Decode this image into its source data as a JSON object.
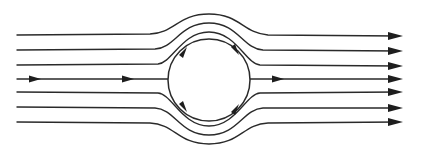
{
  "diagram": {
    "type": "streamlines-around-cylinder",
    "label": "Flow streamlines around a circular cylinder",
    "stroke_color": "#2a2a2a",
    "background": "#ffffff",
    "cylinder": {
      "cx": 209,
      "cy": 80,
      "r": 41
    },
    "streamlines_top": [
      {
        "y_start": 35,
        "y_peak": 14
      },
      {
        "y_start": 50,
        "y_peak": 23
      },
      {
        "y_start": 65,
        "y_peak": 32
      }
    ],
    "centerline": {
      "y": 79,
      "arrows_x": [
        35,
        128,
        278
      ]
    },
    "streamlines_bottom": [
      {
        "y_start": 92,
        "y_trough": 126
      },
      {
        "y_start": 107,
        "y_trough": 135
      },
      {
        "y_start": 122,
        "y_trough": 144
      }
    ],
    "x_start": 17,
    "x_end": 403,
    "surface_arrows": [
      {
        "position": "upper-left",
        "direction": "up-right"
      },
      {
        "position": "upper-right",
        "direction": "down-right"
      },
      {
        "position": "lower-left",
        "direction": "down-right"
      },
      {
        "position": "lower-right",
        "direction": "up-right"
      }
    ]
  }
}
